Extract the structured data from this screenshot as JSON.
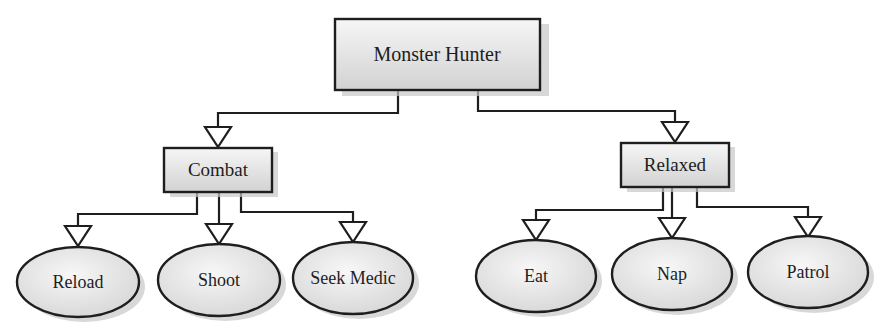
{
  "diagram": {
    "type": "behavior-tree",
    "colors": {
      "stroke": "#1e1e1e",
      "fill_light": "#f4f4f4",
      "fill_dark": "#d6d6d6",
      "shadow": "#c4c4c4"
    },
    "root": {
      "label": "Monster Hunter",
      "shape": "rect"
    },
    "groups": [
      {
        "label": "Combat",
        "shape": "rect",
        "children": [
          {
            "label": "Reload",
            "shape": "ellipse"
          },
          {
            "label": "Shoot",
            "shape": "ellipse"
          },
          {
            "label": "Seek Medic",
            "shape": "ellipse"
          }
        ]
      },
      {
        "label": "Relaxed",
        "shape": "rect",
        "children": [
          {
            "label": "Eat",
            "shape": "ellipse"
          },
          {
            "label": "Nap",
            "shape": "ellipse"
          },
          {
            "label": "Patrol",
            "shape": "ellipse"
          }
        ]
      }
    ]
  }
}
